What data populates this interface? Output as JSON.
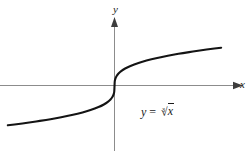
{
  "figure": {
    "background_color": "#ffffff",
    "axis_color": "#8c8c8c",
    "curve_color": "#141414",
    "text_color": "#1a1a1a",
    "y_axis_label": "y",
    "x_axis_label": "x",
    "equation": {
      "lhs": "y",
      "operator": "=",
      "radical_index": "3",
      "radical_sign": "√",
      "radicand": "x",
      "full_text": "y = ∛ x"
    }
  },
  "chart_data": {
    "type": "line",
    "title": "",
    "subtitle": "",
    "xlabel": "x",
    "ylabel": "y",
    "function": "y = cbrt(x)",
    "equation_label": "y = ∛x",
    "grid": false,
    "legend": false,
    "legend_position": "none",
    "tick_labels_x": [],
    "tick_labels_y": [],
    "axis_arrows": [
      "x-positive",
      "y-positive"
    ],
    "origin_px": [
      114,
      86
    ],
    "xlim": [
      -4.2,
      4.2
    ],
    "ylim": [
      -2.6,
      2.6
    ],
    "annotations": [
      {
        "text": "y = ∛x",
        "x": 2.2,
        "y": -1.3
      }
    ],
    "series": [
      {
        "name": "y = cbrt(x)",
        "color": "#141414",
        "x": [
          -4.0,
          -3.6,
          -3.2,
          -2.8,
          -2.4,
          -2.0,
          -1.6,
          -1.2,
          -0.9,
          -0.6,
          -0.4,
          -0.25,
          -0.15,
          -0.08,
          -0.03,
          -0.01,
          0.0,
          0.01,
          0.03,
          0.08,
          0.15,
          0.25,
          0.4,
          0.6,
          0.9,
          1.2,
          1.6,
          2.0,
          2.4,
          2.8,
          3.2,
          3.6,
          4.0
        ],
        "y": [
          -1.587,
          -1.533,
          -1.474,
          -1.409,
          -1.339,
          -1.26,
          -1.17,
          -1.063,
          -0.965,
          -0.843,
          -0.737,
          -0.63,
          -0.531,
          -0.43,
          -0.311,
          -0.215,
          0.0,
          0.215,
          0.311,
          0.43,
          0.531,
          0.63,
          0.737,
          0.843,
          0.965,
          1.063,
          1.17,
          1.26,
          1.339,
          1.409,
          1.474,
          1.533,
          1.587
        ]
      }
    ]
  }
}
